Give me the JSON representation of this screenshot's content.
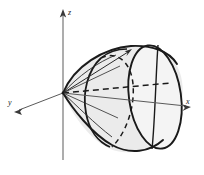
{
  "figure": {
    "background_color": "#ffffff",
    "stroke_color": "#1a1a1a",
    "axis_color": "#4a4a4a",
    "solid_fill_color": "#ebebeb",
    "solid_fill_color_light": "#f4f4f4"
  },
  "axes": {
    "z": {
      "label": "z",
      "direction": "up",
      "arrowhead": true,
      "label_x": 68,
      "label_y": 13
    },
    "y": {
      "label": "y",
      "direction": "down-left",
      "arrowhead": true,
      "label_x": 11,
      "label_y": 104
    },
    "x": {
      "label": "x",
      "direction": "down-right",
      "arrowhead": true,
      "label_x": 189,
      "label_y": 108
    },
    "normal_vector": {
      "label": "",
      "direction": "up-right",
      "arrowhead": true
    }
  },
  "solid": {
    "type": "cone",
    "apex": "origin",
    "opens_toward": "positive-x",
    "cross_sections": [
      {
        "name": "hidden-circle",
        "style": "dashed",
        "visible": false
      },
      {
        "name": "base-ellipse",
        "style": "solid",
        "visible": true
      }
    ]
  },
  "origin": {
    "x": 63,
    "y": 93
  }
}
